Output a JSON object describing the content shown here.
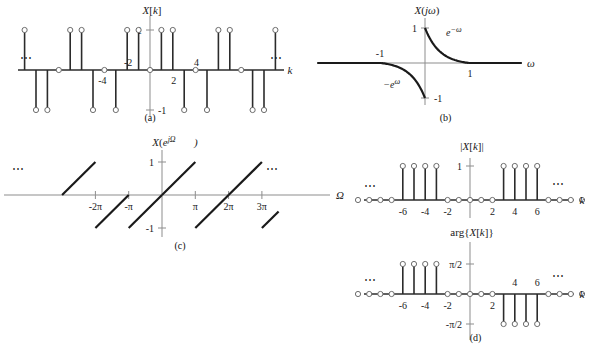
{
  "figure": {
    "panels": [
      {
        "id": "a",
        "caption": "(a)",
        "title": "X[k]",
        "xlabel": "k",
        "ylabels": [
          "1",
          "-1"
        ],
        "xticklabels": [
          "-4",
          "-2",
          "2",
          "4"
        ],
        "leftdots": "⋯",
        "rightdots": "⋯"
      },
      {
        "id": "b",
        "caption": "(b)",
        "title": "X(jω)",
        "xlabel": "ω",
        "ylabels": [
          "1",
          "-1"
        ],
        "xticklabels": [
          "-1",
          "1"
        ],
        "annotations": [
          "e^{-ω}",
          "-e^{ω}"
        ]
      },
      {
        "id": "c",
        "caption": "(c)",
        "title": "X(e^{jΩ})",
        "xlabel": "Ω",
        "ylabels": [
          "1",
          "-1"
        ],
        "xticklabels": [
          "-2π",
          "-π",
          "π",
          "2π",
          "3π"
        ],
        "leftdots": "⋯",
        "rightdots": "⋯"
      },
      {
        "id": "d",
        "caption": "(d)",
        "title_top": "|X[k]|",
        "title_bottom": "arg{X[k]}",
        "xlabel": "k",
        "ylabels_top": [
          "1"
        ],
        "ylabels_bottom": [
          "π/2",
          "-π/2"
        ],
        "xticklabels": [
          "-6",
          "-4",
          "-2",
          "2",
          "4",
          "6"
        ],
        "leftdots": "⋯",
        "rightdots": "⋯"
      }
    ]
  },
  "chart_data": [
    {
      "type": "stem",
      "panel": "a",
      "title": "X[k]",
      "xlabel": "k",
      "ylabel": "",
      "ylim": [
        -1.35,
        1.35
      ],
      "xlim": [
        -11.5,
        11.5
      ],
      "grid": false,
      "yticks": [
        1,
        -1
      ],
      "yticklabels": [
        "1",
        "-1"
      ],
      "xticks": [
        -4,
        -2,
        2,
        4
      ],
      "xticklabels": [
        "-4",
        "-2",
        "2",
        "4"
      ],
      "description": "Odd-symmetric alternating stem train, period 8, zeros at multiples of 4 and at k=0",
      "x": [
        -11,
        -10,
        -9,
        -8,
        -7,
        -6,
        -5,
        -4,
        -3,
        -2,
        -1,
        0,
        1,
        2,
        3,
        4,
        5,
        6,
        7,
        8,
        9,
        10,
        11
      ],
      "values": [
        1,
        -1,
        -1,
        0,
        1,
        1,
        -1,
        0,
        -1,
        1,
        1,
        0,
        1,
        1,
        -1,
        0,
        -1,
        1,
        1,
        0,
        -1,
        -1,
        1
      ]
    },
    {
      "type": "line",
      "panel": "b",
      "title": "X(jω)",
      "xlabel": "ω",
      "ylabel": "",
      "ylim": [
        -1.3,
        1.3
      ],
      "xlim": [
        -2.6,
        2.6
      ],
      "grid": false,
      "yticks": [
        1,
        -1
      ],
      "yticklabels": [
        "1",
        "-1"
      ],
      "xticks": [
        -1,
        1
      ],
      "xticklabels": [
        "-1",
        "1"
      ],
      "annotations": [
        {
          "text": "e^{-ω}",
          "x": 0.45,
          "y": 0.72
        },
        {
          "text": "-e^{ω}",
          "x": -0.72,
          "y": -0.66
        }
      ],
      "segments": [
        {
          "name": "left-flat",
          "x": [
            -2.6,
            -1.0
          ],
          "y": [
            0,
            0
          ]
        },
        {
          "name": "minus-exp",
          "expr": "-e^{ω}",
          "x_from": -1.0,
          "x_to": 0.0,
          "y_from": 0.0,
          "y_to": -1.0
        },
        {
          "name": "exp-decay",
          "expr": "e^{-ω}",
          "x_from": 0.0,
          "x_to": 1.0,
          "y_from": 1.0,
          "y_to": 0.0
        },
        {
          "name": "right-flat",
          "x": [
            1.0,
            2.6
          ],
          "y": [
            0,
            0
          ]
        }
      ]
    },
    {
      "type": "line",
      "panel": "c",
      "title": "X(e^{jΩ})",
      "xlabel": "Ω",
      "ylabel": "",
      "ylim": [
        -1.3,
        1.3
      ],
      "xlim": [
        -9.8,
        11.2
      ],
      "grid": false,
      "yticks": [
        1,
        -1
      ],
      "yticklabels": [
        "1",
        "-1"
      ],
      "xticks": [
        -6.2832,
        -3.1416,
        3.1416,
        6.2832,
        9.4248
      ],
      "xticklabels": [
        "-2π",
        "-π",
        "π",
        "2π",
        "3π"
      ],
      "description": "Periodic sawtooth of period 2π ramping linearly from -1 to +1 over each period",
      "period": 6.2832,
      "ramps": [
        {
          "x_from": -9.4248,
          "x_to": -6.2832,
          "y_from": 0.0,
          "y_to": 1.0
        },
        {
          "x_from": -6.2832,
          "x_to": -3.1416,
          "y_from": -1.0,
          "y_to": 0.0
        },
        {
          "x_from": -3.1416,
          "x_to": 0.0,
          "y_from": -1.0,
          "y_to": 0.0
        },
        {
          "x_from": 0.0,
          "x_to": 3.1416,
          "y_from": 0.0,
          "y_to": 1.0
        },
        {
          "x_from": 3.1416,
          "x_to": 6.2832,
          "y_from": -1.0,
          "y_to": 0.0
        },
        {
          "x_from": 6.2832,
          "x_to": 9.4248,
          "y_from": 0.0,
          "y_to": 1.0
        },
        {
          "x_from": 9.4248,
          "x_to": 11.0,
          "y_from": -1.0,
          "y_to": -0.5
        }
      ]
    },
    {
      "type": "stem",
      "panel": "d-top",
      "title": "|X[k]|",
      "xlabel": "k",
      "ylabel": "",
      "ylim": [
        -0.25,
        1.3
      ],
      "xlim": [
        -10.5,
        10.5
      ],
      "grid": false,
      "yticks": [
        1
      ],
      "yticklabels": [
        "1"
      ],
      "xticks": [
        -6,
        -4,
        -2,
        2,
        4,
        6
      ],
      "xticklabels": [
        "-6",
        "-4",
        "-2",
        "2",
        "4",
        "6"
      ],
      "description": "Magnitude spectrum: unit magnitude for 3<=|k|<=6, zero elsewhere",
      "x": [
        -10,
        -9,
        -8,
        -7,
        -6,
        -5,
        -4,
        -3,
        -2,
        -1,
        0,
        1,
        2,
        3,
        4,
        5,
        6,
        7,
        8,
        9,
        10
      ],
      "values": [
        0,
        0,
        0,
        0,
        1,
        1,
        1,
        1,
        0,
        0,
        0,
        0,
        0,
        1,
        1,
        1,
        1,
        0,
        0,
        0,
        0
      ]
    },
    {
      "type": "stem",
      "panel": "d-bottom",
      "title": "arg{X[k]}",
      "xlabel": "k",
      "ylabel": "",
      "ylim": [
        -1.35,
        1.35
      ],
      "xlim": [
        -10.5,
        10.5
      ],
      "grid": false,
      "yticks": [
        1.5708,
        -1.5708
      ],
      "yticklabels": [
        "π/2",
        "-π/2"
      ],
      "xticks": [
        -6,
        -4,
        -2,
        2,
        4,
        6
      ],
      "xticklabels": [
        "-6",
        "-4",
        "-2",
        "2",
        "4",
        "6"
      ],
      "description": "Phase spectrum: +π/2 for -6<=k<=-3, -π/2 for 3<=k<=6, zero elsewhere",
      "x": [
        -10,
        -9,
        -8,
        -7,
        -6,
        -5,
        -4,
        -3,
        -2,
        -1,
        0,
        1,
        2,
        3,
        4,
        5,
        6,
        7,
        8,
        9,
        10
      ],
      "values": [
        0,
        0,
        0,
        0,
        1.5708,
        1.5708,
        1.5708,
        1.5708,
        0,
        0,
        0,
        0,
        0,
        -1.5708,
        -1.5708,
        -1.5708,
        -1.5708,
        0,
        0,
        0,
        0
      ]
    }
  ]
}
